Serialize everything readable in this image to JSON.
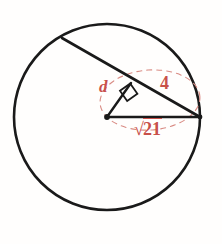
{
  "figure": {
    "background_color": "#fffefd",
    "stroke_color": "#1a1a1a",
    "accent_color": "#c8504a",
    "circle": {
      "center_x": 107,
      "center_y": 117,
      "radius": 93
    },
    "chord": {
      "x1": 62,
      "y1": 38,
      "x2": 200,
      "y2": 117
    },
    "radius_segment": {
      "x1": 107,
      "y1": 117,
      "x2": 200,
      "y2": 117
    },
    "perpendicular_segment": {
      "x1": 107,
      "y1": 117,
      "x2": 131,
      "y2": 83
    },
    "right_angle_marker": {
      "size": 13,
      "vertex_x": 131,
      "vertex_y": 83
    },
    "dashed_ellipse": {
      "cx": 150,
      "cy": 100,
      "rx": 50,
      "ry": 30,
      "rotation": -4
    }
  },
  "labels": {
    "distance": "d",
    "half_chord": "4",
    "radius": "21",
    "radical_symbol": "√"
  }
}
